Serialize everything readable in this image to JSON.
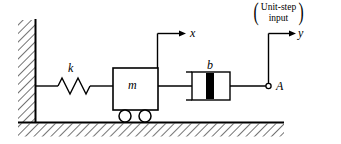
{
  "figure": {
    "type": "mechanical-system-diagram",
    "stroke_color": "#000000",
    "background_color": "#ffffff",
    "hatch_color": "#000000"
  },
  "labels": {
    "spring": "k",
    "mass": "m",
    "damper": "b",
    "mass_displacement": "x",
    "input_displacement": "y",
    "input_point": "A"
  },
  "annotation": {
    "open_paren": "(",
    "close_paren": ")",
    "line1": "Unit-step",
    "line2": "input"
  },
  "components": {
    "wall": {
      "name": "fixed-wall",
      "hatched": true
    },
    "ground": {
      "name": "ground-surface",
      "hatched": true
    },
    "spring": {
      "name": "spring-k",
      "coils": 4
    },
    "mass_block": {
      "name": "mass-m",
      "wheels": 2
    },
    "damper": {
      "name": "damper-b",
      "piston_filled": true
    },
    "arrows": [
      "x",
      "y"
    ]
  }
}
